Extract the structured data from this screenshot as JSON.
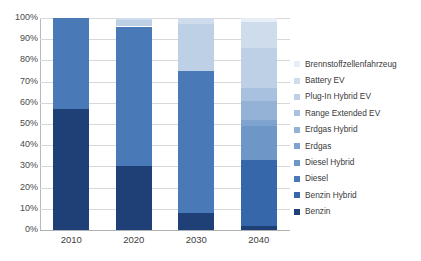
{
  "chart_data": {
    "type": "bar",
    "subtype": "stacked-100-percent",
    "title": "",
    "xlabel": "",
    "ylabel": "",
    "categories": [
      "2010",
      "2020",
      "2030",
      "2040"
    ],
    "ylim": [
      0,
      100
    ],
    "ytick_labels": [
      "0%",
      "10%",
      "20%",
      "30%",
      "40%",
      "50%",
      "60%",
      "70%",
      "80%",
      "90%",
      "100%"
    ],
    "ytick_values": [
      0,
      10,
      20,
      30,
      40,
      50,
      60,
      70,
      80,
      90,
      100
    ],
    "grid": true,
    "legend_position": "right",
    "series": [
      {
        "name": "Brennstoffzellenfahrzeug",
        "color": "#e8eef6",
        "values": [
          0,
          0,
          0,
          2
        ]
      },
      {
        "name": "Battery EV",
        "color": "#cfdcec",
        "values": [
          0,
          1,
          3,
          12
        ]
      },
      {
        "name": "Plug-In Hybrid EV",
        "color": "#bdd0e6",
        "values": [
          0,
          3,
          22,
          19
        ]
      },
      {
        "name": "Range Extended EV",
        "color": "#a8c1de",
        "values": [
          0,
          0,
          0,
          6
        ]
      },
      {
        "name": "Erdgas Hybrid",
        "color": "#93b2d6",
        "values": [
          0,
          0,
          0,
          9
        ]
      },
      {
        "name": "Erdgas",
        "color": "#7ea3ce",
        "values": [
          0,
          0,
          0,
          3
        ]
      },
      {
        "name": "Diesel Hybrid",
        "color": "#6e97c8",
        "values": [
          0,
          0,
          0,
          16
        ]
      },
      {
        "name": "Diesel",
        "color": "#4a79b8",
        "values": [
          43,
          66,
          67,
          0
        ]
      },
      {
        "name": "Benzin Hybrid",
        "color": "#3767ab",
        "values": [
          0,
          0,
          0,
          31
        ]
      },
      {
        "name": "Benzin",
        "color": "#1f3f77",
        "values": [
          57,
          30,
          8,
          2
        ]
      }
    ]
  },
  "legend": {
    "items": [
      {
        "label": "Brennstoffzellenfahrzeug",
        "color": "#e8eef6"
      },
      {
        "label": "Battery EV",
        "color": "#cfdcec"
      },
      {
        "label": "Plug-In Hybrid EV",
        "color": "#bdd0e6"
      },
      {
        "label": "Range Extended EV",
        "color": "#a8c1de"
      },
      {
        "label": "Erdgas Hybrid",
        "color": "#93b2d6"
      },
      {
        "label": "Erdgas",
        "color": "#7ea3ce"
      },
      {
        "label": "Diesel Hybrid",
        "color": "#6e97c8"
      },
      {
        "label": "Diesel",
        "color": "#4a79b8"
      },
      {
        "label": "Benzin Hybrid",
        "color": "#3767ab"
      },
      {
        "label": "Benzin",
        "color": "#1f3f77"
      }
    ]
  }
}
